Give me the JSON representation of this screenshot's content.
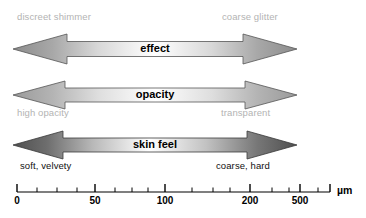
{
  "figure": {
    "width_px": 366,
    "height_px": 218,
    "background": "#ffffff"
  },
  "rows": [
    {
      "id": "effect",
      "caption": "effect",
      "left_label": "discreet shimmer",
      "right_label": "coarse glitter",
      "label_position": "above",
      "label_color": "#b3b3b3",
      "arrow_edge_color": "#8c8c8c",
      "arrow_center_color": "#ffffff",
      "arrow_outline_color": "#555555"
    },
    {
      "id": "opacity",
      "caption": "opacity",
      "left_label": "high opacity",
      "right_label": "transparent",
      "label_position": "below",
      "label_color": "#b3b3b3",
      "arrow_edge_color": "#9a9a9a",
      "arrow_center_color": "#ffffff",
      "arrow_outline_color": "#555555"
    },
    {
      "id": "skin-feel",
      "caption": "skin feel",
      "left_label": "soft, velvety",
      "right_label": "coarse, hard",
      "label_position": "below",
      "label_color": "#111111",
      "arrow_edge_color": "#555555",
      "arrow_center_color": "#ffffff",
      "arrow_outline_color": "#3a3a3a"
    }
  ],
  "axis": {
    "unit": "µm",
    "line_color": "#000000",
    "major_labels": [
      "0",
      "50",
      "100",
      "200",
      "500"
    ],
    "major_label_positions_px": [
      17,
      95,
      165,
      250,
      300
    ],
    "tick_positions_px": [
      17,
      37,
      57,
      77,
      95,
      115,
      132,
      148,
      165,
      192,
      213,
      230,
      250,
      272,
      289,
      300,
      318
    ],
    "major_tick_indices": [
      0,
      4,
      8,
      12,
      15
    ],
    "axis_start_px": 17,
    "axis_end_px": 330,
    "scale_type": "logarithmic"
  },
  "chart_data": {
    "type": "diagram",
    "xlabel": "µm",
    "ylabel": "",
    "x_scale": "log",
    "x_ticks": [
      0,
      50,
      100,
      200,
      500
    ],
    "series": [
      {
        "name": "effect",
        "left_end": "discreet shimmer",
        "right_end": "coarse glitter"
      },
      {
        "name": "opacity",
        "left_end": "high opacity",
        "right_end": "transparent"
      },
      {
        "name": "skin feel",
        "left_end": "soft, velvety",
        "right_end": "coarse, hard"
      }
    ],
    "legend": "none",
    "grid": false
  }
}
